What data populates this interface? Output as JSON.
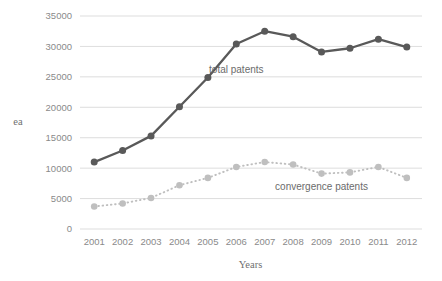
{
  "chart_data": {
    "type": "line",
    "title": "",
    "xlabel": "Years",
    "ylabel": "ea",
    "categories": [
      "2001",
      "2002",
      "2003",
      "2004",
      "2005",
      "2006",
      "2007",
      "2008",
      "2009",
      "2010",
      "2011",
      "2012"
    ],
    "ylim": [
      0,
      35000
    ],
    "ytick_labels": [
      "35000",
      "30000",
      "25000",
      "20000",
      "15000",
      "10000",
      "5000",
      "0"
    ],
    "ytick_values": [
      35000,
      30000,
      25000,
      20000,
      15000,
      10000,
      5000,
      0
    ],
    "grid": true,
    "legend_position": "inline-annotations",
    "series": [
      {
        "name": "total patents",
        "color": "#595959",
        "line_style": "solid",
        "marker": "circle",
        "values": [
          11000,
          12900,
          15300,
          20100,
          24900,
          30400,
          32500,
          31600,
          29100,
          29700,
          31200,
          29900
        ],
        "annotation": "total patents"
      },
      {
        "name": "convergence patents",
        "color": "#bfbfbf",
        "line_style": "dotted",
        "marker": "circle",
        "values": [
          3700,
          4200,
          5100,
          7200,
          8400,
          10200,
          11000,
          10600,
          9100,
          9300,
          10200,
          8400
        ],
        "annotation": "convergence patents"
      }
    ],
    "annotations": [
      {
        "text": "total patents",
        "x_category": "2006",
        "value": 25600
      },
      {
        "text": "convergence patents",
        "x_category": "2009",
        "value": 6400
      }
    ],
    "colors": {
      "background": "#ffffff",
      "grid": "#d4d4d4",
      "text": "#7f7f7f",
      "series_total": "#595959",
      "series_convergence": "#bfbfbf"
    }
  }
}
